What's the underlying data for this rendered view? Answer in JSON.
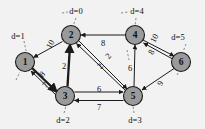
{
  "figure": {
    "background_color": "#f2f2f2",
    "node_fill": "#9a9a9a",
    "node_stroke": "#1a1a1a",
    "edge_color": "#1a1a1a",
    "leader_color": "#6d6d6d"
  },
  "nodes": [
    {
      "id": "1",
      "label": "1",
      "cx": 25,
      "cy": 62,
      "r": 9.5,
      "dist_label": "d=1",
      "dist_x": 18,
      "dist_y": 36
    },
    {
      "id": "2",
      "label": "2",
      "cx": 71,
      "cy": 35,
      "r": 9.5,
      "dist_label": "d=0",
      "dist_x": 76,
      "dist_y": 11
    },
    {
      "id": "3",
      "label": "3",
      "cx": 65,
      "cy": 96,
      "r": 9.5,
      "dist_label": "d=2",
      "dist_x": 63,
      "dist_y": 120
    },
    {
      "id": "4",
      "label": "4",
      "cx": 135,
      "cy": 35,
      "r": 9.5,
      "dist_label": "d=4",
      "dist_x": 137,
      "dist_y": 11
    },
    {
      "id": "5",
      "label": "5",
      "cx": 133,
      "cy": 96,
      "r": 9.5,
      "dist_label": "d=3",
      "dist_x": 135,
      "dist_y": 120
    },
    {
      "id": "6",
      "label": "6",
      "cx": 181,
      "cy": 62,
      "r": 9.5,
      "dist_label": "d=5",
      "dist_x": 178,
      "dist_y": 37
    }
  ],
  "edges": [
    {
      "id": "e2-1",
      "from": "2",
      "to": "1",
      "weight": "10",
      "wx": 50,
      "wy": 44,
      "thick": false
    },
    {
      "id": "e1-3",
      "from": "1",
      "to": "3",
      "weight": "8",
      "wx": 42,
      "wy": 74,
      "thick": true
    },
    {
      "id": "e3-1",
      "from": "3",
      "to": "1",
      "weight": "7",
      "wx": 45,
      "wy": 85,
      "thick": false
    },
    {
      "id": "e3-2",
      "from": "3",
      "to": "2",
      "weight": "2",
      "wx": 64,
      "wy": 66,
      "thick": true
    },
    {
      "id": "e4-2",
      "from": "4",
      "to": "2",
      "weight": "8",
      "wx": 103,
      "wy": 43,
      "thick": false
    },
    {
      "id": "e2-5",
      "from": "2",
      "to": "5",
      "weight": "2",
      "wx": 108,
      "wy": 56,
      "thick": false
    },
    {
      "id": "e5-2",
      "from": "5",
      "to": "2",
      "weight": "2",
      "wx": 100,
      "wy": 66,
      "thick": false
    },
    {
      "id": "e3-5",
      "from": "3",
      "to": "5",
      "weight": "6",
      "wx": 99,
      "wy": 89,
      "thick": false
    },
    {
      "id": "e5-3",
      "from": "5",
      "to": "3",
      "weight": "7",
      "wx": 99,
      "wy": 107,
      "thick": false
    },
    {
      "id": "e5-4",
      "from": "5",
      "to": "4",
      "weight": "6",
      "wx": 130,
      "wy": 68,
      "thick": false
    },
    {
      "id": "e4-6",
      "from": "4",
      "to": "6",
      "weight": "10",
      "wx": 154,
      "wy": 38,
      "thick": false
    },
    {
      "id": "e6-4",
      "from": "6",
      "to": "4",
      "weight": "8",
      "wx": 151,
      "wy": 52,
      "thick": false
    },
    {
      "id": "e6-5",
      "from": "6",
      "to": "5",
      "weight": "9",
      "wx": 160,
      "wy": 83,
      "thick": false
    }
  ]
}
